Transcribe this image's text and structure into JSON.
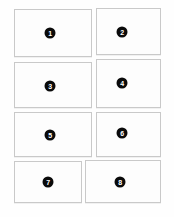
{
  "canvas": {
    "width": 174,
    "height": 217,
    "background_color": "#fefefe"
  },
  "style": {
    "panel_fill": "#ffffff",
    "panel_border_color": "#c9c9c9",
    "badge_fill": "#0a0a0a",
    "badge_text_color": "#ffffff"
  },
  "panels": [
    {
      "number": "1",
      "x": 14,
      "y": 9,
      "w": 78,
      "h": 48,
      "badge_x": 50,
      "badge_y": 33
    },
    {
      "number": "2",
      "x": 96,
      "y": 8,
      "w": 65,
      "h": 47,
      "badge_x": 122,
      "badge_y": 32
    },
    {
      "number": "3",
      "x": 14,
      "y": 62,
      "w": 78,
      "h": 46,
      "badge_x": 50,
      "badge_y": 86
    },
    {
      "number": "4",
      "x": 96,
      "y": 59,
      "w": 65,
      "h": 49,
      "badge_x": 122,
      "badge_y": 83
    },
    {
      "number": "5",
      "x": 14,
      "y": 112,
      "w": 78,
      "h": 45,
      "badge_x": 50,
      "badge_y": 135
    },
    {
      "number": "6",
      "x": 96,
      "y": 112,
      "w": 65,
      "h": 45,
      "badge_x": 122,
      "badge_y": 133
    },
    {
      "number": "7",
      "x": 14,
      "y": 161,
      "w": 68,
      "h": 42,
      "badge_x": 48,
      "badge_y": 182
    },
    {
      "number": "8",
      "x": 85,
      "y": 160,
      "w": 76,
      "h": 43,
      "badge_x": 120,
      "badge_y": 182
    }
  ]
}
